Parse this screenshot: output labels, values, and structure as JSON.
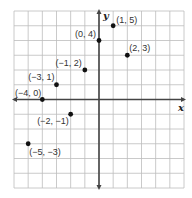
{
  "chart_data": {
    "type": "scatter",
    "title": "",
    "xlabel": "x",
    "ylabel": "y",
    "xlim": [
      -6,
      6
    ],
    "ylim": [
      -6,
      6
    ],
    "grid": true,
    "tick_labels": false,
    "points": [
      {
        "x": 1,
        "y": 5,
        "label": "(1, 5)"
      },
      {
        "x": 0,
        "y": 4,
        "label": "(0, 4)"
      },
      {
        "x": 2,
        "y": 3,
        "label": "(2, 3)"
      },
      {
        "x": -1,
        "y": 2,
        "label": "(−1, 2)"
      },
      {
        "x": -3,
        "y": 1,
        "label": "(−3, 1)"
      },
      {
        "x": -4,
        "y": 0,
        "label": "(−4, 0)"
      },
      {
        "x": -2,
        "y": -1,
        "label": "(−2, −1)"
      },
      {
        "x": -5,
        "y": -3,
        "label": "(−5, −3)"
      }
    ]
  },
  "colors": {
    "grid": "#bdbdbd",
    "axis": "#444444",
    "point": "#111111",
    "label": "#333333"
  }
}
